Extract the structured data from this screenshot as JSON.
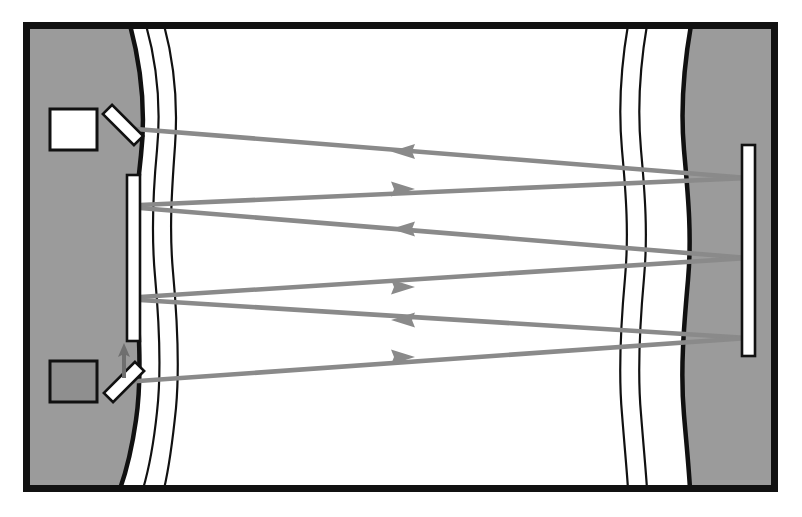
{
  "figure": {
    "kind": "optical-beam-path-diagram",
    "title": "",
    "caption": "",
    "canvas": {
      "width": 802,
      "height": 517
    },
    "background_color": "#ffffff"
  },
  "colors": {
    "page_background": "#ffffff",
    "frame_stroke": "#111111",
    "medium_fill": "#9b9b9b",
    "channel_fill": "#ffffff",
    "wave_line_stroke": "#111111",
    "beam_stroke": "#8a8a8a",
    "beam_arrow_fill": "#8a8a8a",
    "mirror_fill": "#ffffff",
    "mirror_stroke": "#111111",
    "source_box_fill": "#ffffff",
    "detector_box_fill": "#8f8f8f",
    "component_stroke": "#111111",
    "pointer_arrow_stroke": "#6f6f6f"
  },
  "frame": {
    "label": "outer-border",
    "x": 23,
    "y": 22,
    "width": 755,
    "height": 470,
    "stroke_width": 7
  },
  "media": [
    {
      "name": "left-medium-block",
      "side": "left",
      "fill": "#9b9b9b",
      "description": "left solid region with curved inner boundary"
    },
    {
      "name": "right-medium-block",
      "side": "right",
      "fill": "#9b9b9b",
      "description": "right solid region with curved inner boundary"
    }
  ],
  "channel": {
    "name": "open-channel",
    "fill": "#ffffff",
    "description": "white gap between the two media"
  },
  "wave_lines": {
    "count": 6,
    "description": "wavy vertical interface contour lines",
    "left_group": [
      {
        "name": "left-boundary-wave-thick",
        "stroke_width": 4.5
      },
      {
        "name": "left-wave-line-1",
        "stroke_width": 2.2
      },
      {
        "name": "left-wave-line-2",
        "stroke_width": 2.2
      }
    ],
    "right_group": [
      {
        "name": "right-wave-line-1",
        "stroke_width": 2.2
      },
      {
        "name": "right-wave-line-2",
        "stroke_width": 2.2
      },
      {
        "name": "right-boundary-wave-thick",
        "stroke_width": 4.5
      }
    ]
  },
  "components": [
    {
      "name": "source-box",
      "type": "box",
      "fill": "#ffffff",
      "x": 50,
      "y": 109,
      "width": 47,
      "height": 41,
      "note": "white square at upper left"
    },
    {
      "name": "detector-box",
      "type": "box",
      "fill": "#8f8f8f",
      "x": 50,
      "y": 361,
      "width": 47,
      "height": 41,
      "note": "shaded square at lower left"
    },
    {
      "name": "upper-beamsplitter",
      "type": "tilted-mirror",
      "fill": "#ffffff",
      "cx": 123,
      "cy": 125,
      "length": 44,
      "thickness": 13,
      "angle_deg": 45,
      "note": "tilted like a backslash"
    },
    {
      "name": "lower-beamsplitter",
      "type": "tilted-mirror",
      "fill": "#ffffff",
      "cx": 124,
      "cy": 382,
      "length": 44,
      "thickness": 13,
      "angle_deg": -45,
      "note": "tilted like a forward slash"
    },
    {
      "name": "left-vertical-mirror",
      "type": "mirror-bar",
      "fill": "#ffffff",
      "x": 127,
      "y": 175,
      "width": 13,
      "height": 166
    },
    {
      "name": "right-vertical-mirror",
      "type": "mirror-bar",
      "fill": "#ffffff",
      "x": 742,
      "y": 145,
      "width": 13,
      "height": 211
    },
    {
      "name": "internal-pointer-arrow",
      "type": "arrow",
      "from": [
        124,
        376
      ],
      "to": [
        124,
        345
      ],
      "direction": "up",
      "note": "short arrow from lower splitter to left mirror"
    }
  ],
  "beams": [
    {
      "id": "beam-1",
      "name": "beam-leftward-upper",
      "direction": "leftward",
      "start": [
        748,
        178
      ],
      "end": [
        123,
        128
      ],
      "arrow_at": [
        403,
        152
      ]
    },
    {
      "id": "beam-2",
      "name": "beam-rightward-upper",
      "direction": "rightward",
      "start": [
        140,
        205
      ],
      "end": [
        748,
        178
      ],
      "arrow_at": [
        403,
        189
      ]
    },
    {
      "id": "beam-3",
      "name": "beam-leftward-middle",
      "direction": "leftward",
      "start": [
        748,
        258
      ],
      "end": [
        140,
        208
      ],
      "arrow_at": [
        403,
        229
      ]
    },
    {
      "id": "beam-4",
      "name": "beam-rightward-middle",
      "direction": "rightward",
      "start": [
        140,
        297
      ],
      "end": [
        748,
        258
      ],
      "arrow_at": [
        403,
        287
      ]
    },
    {
      "id": "beam-5",
      "name": "beam-leftward-lower",
      "direction": "leftward",
      "start": [
        748,
        338
      ],
      "end": [
        140,
        300
      ],
      "arrow_at": [
        403,
        320
      ]
    },
    {
      "id": "beam-6",
      "name": "beam-rightward-lower",
      "direction": "rightward",
      "start": [
        124,
        382
      ],
      "end": [
        748,
        338
      ],
      "arrow_at": [
        403,
        357
      ]
    }
  ],
  "annotations": {
    "text_labels": []
  }
}
